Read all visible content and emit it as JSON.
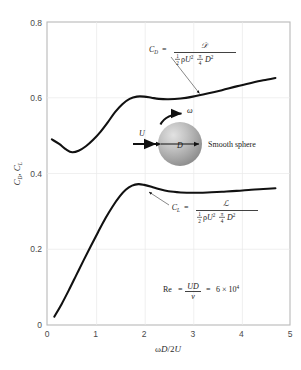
{
  "chart_data": {
    "type": "line",
    "title": "",
    "xlabel": "ωD/2U",
    "ylabel": "C_D, C_L",
    "xlim": [
      0,
      5
    ],
    "ylim": [
      0,
      0.8
    ],
    "xticks": [
      "0",
      "1",
      "2",
      "3",
      "4",
      "5"
    ],
    "yticks": [
      "0",
      "0.2",
      "0.4",
      "0.6",
      "0.8"
    ],
    "grid": true,
    "legend": "none",
    "series": [
      {
        "name": "C_D",
        "label": "Drag coefficient",
        "color": "#111111",
        "points": [
          [
            0.1,
            0.49
          ],
          [
            0.25,
            0.478
          ],
          [
            0.4,
            0.463
          ],
          [
            0.52,
            0.456
          ],
          [
            0.65,
            0.46
          ],
          [
            0.8,
            0.472
          ],
          [
            0.95,
            0.489
          ],
          [
            1.1,
            0.51
          ],
          [
            1.25,
            0.535
          ],
          [
            1.4,
            0.562
          ],
          [
            1.55,
            0.583
          ],
          [
            1.7,
            0.597
          ],
          [
            1.85,
            0.603
          ],
          [
            2.0,
            0.603
          ],
          [
            2.15,
            0.6
          ],
          [
            2.3,
            0.597
          ],
          [
            2.5,
            0.596
          ],
          [
            2.75,
            0.598
          ],
          [
            3.0,
            0.603
          ],
          [
            3.3,
            0.611
          ],
          [
            3.6,
            0.62
          ],
          [
            3.9,
            0.63
          ],
          [
            4.2,
            0.639
          ],
          [
            4.45,
            0.646
          ],
          [
            4.7,
            0.652
          ]
        ]
      },
      {
        "name": "C_L",
        "label": "Lift coefficient",
        "color": "#111111",
        "points": [
          [
            0.15,
            0.022
          ],
          [
            0.3,
            0.055
          ],
          [
            0.45,
            0.092
          ],
          [
            0.6,
            0.131
          ],
          [
            0.75,
            0.17
          ],
          [
            0.9,
            0.208
          ],
          [
            1.05,
            0.245
          ],
          [
            1.2,
            0.281
          ],
          [
            1.35,
            0.313
          ],
          [
            1.5,
            0.34
          ],
          [
            1.62,
            0.357
          ],
          [
            1.75,
            0.368
          ],
          [
            1.88,
            0.372
          ],
          [
            2.0,
            0.37
          ],
          [
            2.15,
            0.365
          ],
          [
            2.3,
            0.359
          ],
          [
            2.5,
            0.353
          ],
          [
            2.75,
            0.35
          ],
          [
            3.0,
            0.349
          ],
          [
            3.3,
            0.35
          ],
          [
            3.6,
            0.352
          ],
          [
            3.9,
            0.354
          ],
          [
            4.2,
            0.357
          ],
          [
            4.45,
            0.359
          ],
          [
            4.7,
            0.361
          ]
        ]
      }
    ]
  },
  "annotations": {
    "drag_formula": {
      "symbol": "C",
      "subscript": "D",
      "equals": "=",
      "numerator": "𝒟",
      "denominator_parts": {
        "half_num": "1",
        "half_den": "2",
        "rho": "ρ",
        "u": "U",
        "u_exp": "2",
        "pi_num": "π",
        "pi_den": "4",
        "d": "D",
        "d_exp": "2"
      }
    },
    "lift_formula": {
      "symbol": "C",
      "subscript": "L",
      "equals": "=",
      "numerator": "ℒ",
      "denominator_parts": {
        "half_num": "1",
        "half_den": "2",
        "rho": "ρ",
        "u": "U",
        "u_exp": "2",
        "pi_num": "π",
        "pi_den": "4",
        "d": "D",
        "d_exp": "2"
      }
    },
    "reynolds": {
      "re": "Re",
      "equals1": "=",
      "numerator": "UD",
      "denominator": "ν",
      "equals2": "=",
      "value": "6 × 10",
      "exponent": "4"
    },
    "diagram": {
      "velocity_label": "U",
      "omega_label": "ω",
      "diameter_label": "D",
      "sphere_label": "Smooth sphere"
    }
  }
}
